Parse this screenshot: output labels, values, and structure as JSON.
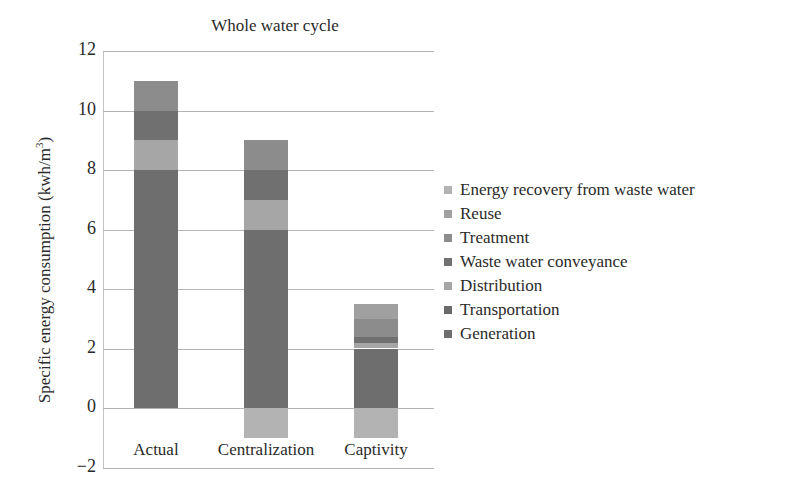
{
  "chart_data": {
    "type": "bar",
    "stacked": true,
    "title": "Whole water cycle",
    "xlabel": "",
    "ylabel": "Specific energy consumption (kwh/m3)",
    "ylabel_main": "Specific energy consumption (kwh/m",
    "ylabel_sup": "3",
    "ylabel_close": ")",
    "ylim": [
      -2,
      12
    ],
    "yticks": [
      {
        "value": 12,
        "label": "12"
      },
      {
        "value": 10,
        "label": "10"
      },
      {
        "value": 8,
        "label": "8"
      },
      {
        "value": 6,
        "label": "6"
      },
      {
        "value": 4,
        "label": "4"
      },
      {
        "value": 2,
        "label": "2"
      },
      {
        "value": 0,
        "label": "0"
      },
      {
        "value": -2,
        "label": "−2"
      }
    ],
    "grid": true,
    "legend_position": "right",
    "categories": [
      "Actual",
      "Centralization",
      "Captivity"
    ],
    "series": [
      {
        "name": "Generation",
        "color": "#6e6e6e",
        "values": [
          8,
          6,
          2
        ]
      },
      {
        "name": "Transportation",
        "color": "#6a6a6a",
        "values": [
          0,
          0,
          0
        ]
      },
      {
        "name": "Distribution",
        "color": "#a6a6a6",
        "values": [
          1,
          1,
          0.2
        ]
      },
      {
        "name": "Waste water conveyance",
        "color": "#707070",
        "values": [
          1,
          1,
          0.2
        ]
      },
      {
        "name": "Treatment",
        "color": "#8c8c8c",
        "values": [
          1,
          1,
          0.6
        ]
      },
      {
        "name": "Reuse",
        "color": "#a0a0a0",
        "values": [
          0,
          0,
          0.5
        ]
      },
      {
        "name": "Energy recovery from waste water",
        "color": "#b3b3b3",
        "values": [
          0,
          -1,
          -1
        ]
      }
    ],
    "legend_order": [
      "Energy recovery from waste water",
      "Reuse",
      "Treatment",
      "Waste water conveyance",
      "Distribution",
      "Transportation",
      "Generation"
    ]
  }
}
